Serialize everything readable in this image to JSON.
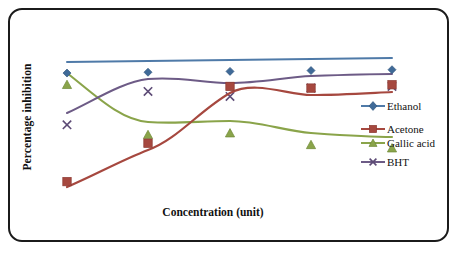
{
  "chart_data": {
    "type": "line",
    "title": "",
    "xlabel": "Concentration (unit)",
    "ylabel": "Percentage inhibition",
    "categories": [
      "1",
      "2",
      "3",
      "4",
      "5"
    ],
    "x": [
      1,
      2,
      3,
      4,
      5
    ],
    "axis_ticks_shown": false,
    "grid": false,
    "legend_position": "right",
    "ylim": [
      0,
      100
    ],
    "series": [
      {
        "name": "Ethanol",
        "color": "#4f7aa8",
        "marker": "diamond",
        "values": [
          82,
          82.5,
          83,
          83.5,
          84
        ]
      },
      {
        "name": "Acetone",
        "color": "#a6483f",
        "marker": "square",
        "values": [
          17,
          40,
          74,
          73,
          75
        ]
      },
      {
        "name": "Gallic acid",
        "color": "#8aa44a",
        "marker": "triangle",
        "values": [
          75,
          45,
          46,
          39,
          37
        ]
      },
      {
        "name": "BHT",
        "color": "#6d5b86",
        "marker": "cross",
        "values": [
          51,
          71,
          68,
          73,
          74
        ]
      }
    ]
  },
  "legend": {
    "items": [
      {
        "label": "Ethanol"
      },
      {
        "label": "Acetone"
      },
      {
        "label": "Gallic acid"
      },
      {
        "label": "BHT"
      }
    ]
  },
  "colors": {
    "ethanol": "#4f7aa8",
    "acetone": "#a6483f",
    "gallic_acid": "#8aa44a",
    "bht": "#6d5b86",
    "border": "#1b1b1b",
    "background": "#ffffff"
  }
}
